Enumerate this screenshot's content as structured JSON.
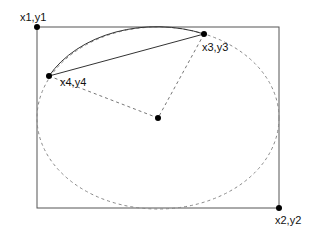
{
  "diagram": {
    "points": {
      "p1": {
        "label": "x1,y1",
        "x": 37,
        "y": 27
      },
      "p2": {
        "label": "x2,y2",
        "x": 279,
        "y": 208
      },
      "p3": {
        "label": "x3,y3",
        "x": 204,
        "y": 34
      },
      "p4": {
        "label": "x4,y4",
        "x": 49,
        "y": 76
      },
      "center": {
        "x": 158,
        "y": 118
      }
    },
    "colors": {
      "stroke": "#333333",
      "dashed": "#777777",
      "dot": "#000000"
    }
  }
}
